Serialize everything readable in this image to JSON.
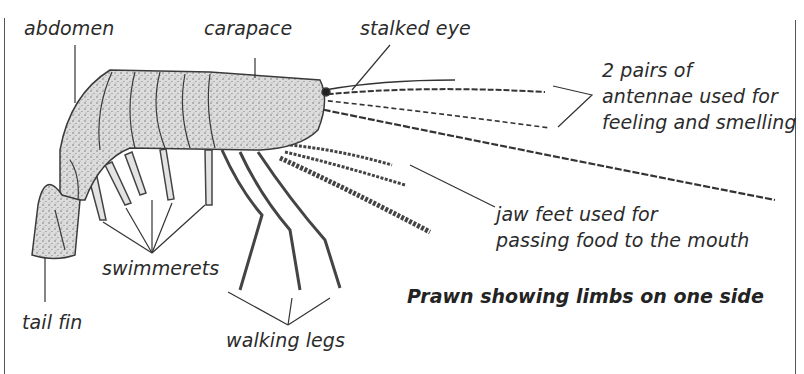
{
  "diagram": {
    "title": "Prawn showing limbs on one side",
    "labels": {
      "abdomen": "abdomen",
      "carapace": "carapace",
      "stalked_eye": "stalked eye",
      "antennae_line1": "2 pairs of",
      "antennae_line2": "antennae used for",
      "antennae_line3": "feeling and smelling",
      "jaw_feet_line1": "jaw feet used for",
      "jaw_feet_line2": "passing food to the mouth",
      "swimmerets": "swimmerets",
      "tail_fin": "tail fin",
      "walking_legs": "walking legs"
    },
    "colors": {
      "body_fill": "#d8d8d8",
      "outline": "#3a3a3a",
      "text": "#2b2b2b"
    }
  }
}
